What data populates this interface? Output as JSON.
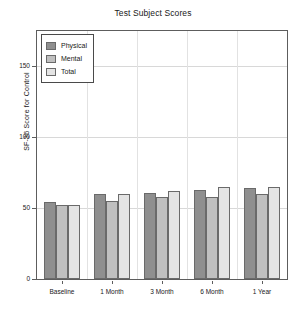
{
  "chart_data": {
    "type": "bar",
    "title": "Test Subject Scores",
    "xlabel": "",
    "ylabel": "SF-36 Score for Control",
    "categories": [
      "Baseline",
      "1 Month",
      "3 Month",
      "6 Month",
      "1 Year"
    ],
    "series": [
      {
        "name": "Physical",
        "values": [
          54,
          60,
          61,
          63,
          64
        ],
        "color": "#8f8f8f"
      },
      {
        "name": "Mental",
        "values": [
          52,
          55,
          58,
          58,
          60
        ],
        "color": "#c0c0c0"
      },
      {
        "name": "Total",
        "values": [
          52,
          60,
          62,
          65,
          65
        ],
        "color": "#e4e4e4"
      }
    ],
    "ylim": [
      0,
      175
    ],
    "yticks": [
      0,
      50,
      100,
      150
    ],
    "ytick_labels": [
      "0",
      "50",
      "100",
      "150"
    ],
    "grid": true,
    "legend_position": "upper-left"
  },
  "legend": {
    "items": [
      {
        "label": "Physical"
      },
      {
        "label": "Mental"
      },
      {
        "label": "Total"
      }
    ]
  }
}
